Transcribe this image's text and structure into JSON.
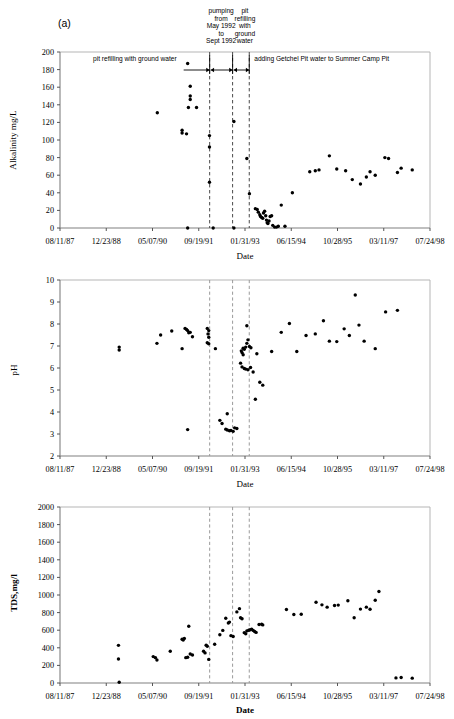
{
  "figure": {
    "panel_label": "(a)",
    "date_axis_title": "Date",
    "x_tick_labels": [
      "08/11/87",
      "12/23/88",
      "05/07/90",
      "09/19/91",
      "01/31/93",
      "06/15/94",
      "10/28/95",
      "03/11/97",
      "07/24/98"
    ],
    "marker_color": "#000000",
    "dashed_line_color": "#9a9a9a",
    "axis_color": "#808080"
  },
  "annotations": {
    "left_span_label": "pit refilling with ground water",
    "pumping_label_lines": [
      "pumping",
      "from",
      "May 1992",
      "to",
      "Sept 1992"
    ],
    "refilling_label_lines": [
      "pit",
      "refilling",
      "with",
      "ground",
      "water"
    ],
    "right_span_label": "adding Getchel Pit water to Summer Camp Pit"
  },
  "chart_data": [
    {
      "type": "scatter",
      "title": "",
      "xlabel": "Date",
      "ylabel": "Alkalinity  mg/L",
      "ylim": [
        0,
        200
      ],
      "ytick_labels": [
        "0",
        "20",
        "40",
        "60",
        "80",
        "100",
        "120",
        "140",
        "160",
        "180",
        "200"
      ],
      "ytick_values": [
        0,
        20,
        40,
        60,
        80,
        100,
        120,
        140,
        160,
        180,
        200
      ],
      "xlim": [
        "08/11/87",
        "07/24/98"
      ],
      "grid": false,
      "legend": "none",
      "event_lines": [
        "05/1992",
        "11/1992",
        "03/1993"
      ],
      "points": [
        {
          "x": 0.263,
          "y": 131
        },
        {
          "x": 0.345,
          "y": 187
        },
        {
          "x": 0.352,
          "y": 161
        },
        {
          "x": 0.352,
          "y": 150
        },
        {
          "x": 0.352,
          "y": 146
        },
        {
          "x": 0.347,
          "y": 137
        },
        {
          "x": 0.369,
          "y": 137
        },
        {
          "x": 0.33,
          "y": 111
        },
        {
          "x": 0.33,
          "y": 108
        },
        {
          "x": 0.342,
          "y": 107
        },
        {
          "x": 0.345,
          "y": 0
        },
        {
          "x": 0.404,
          "y": 105
        },
        {
          "x": 0.404,
          "y": 92
        },
        {
          "x": 0.404,
          "y": 52
        },
        {
          "x": 0.414,
          "y": 0
        },
        {
          "x": 0.47,
          "y": 121
        },
        {
          "x": 0.47,
          "y": 0
        },
        {
          "x": 0.505,
          "y": 79
        },
        {
          "x": 0.512,
          "y": 39
        },
        {
          "x": 0.528,
          "y": 22
        },
        {
          "x": 0.533,
          "y": 21
        },
        {
          "x": 0.536,
          "y": 18
        },
        {
          "x": 0.54,
          "y": 15
        },
        {
          "x": 0.542,
          "y": 13
        },
        {
          "x": 0.545,
          "y": 12
        },
        {
          "x": 0.548,
          "y": 11
        },
        {
          "x": 0.55,
          "y": 17
        },
        {
          "x": 0.553,
          "y": 19
        },
        {
          "x": 0.556,
          "y": 14
        },
        {
          "x": 0.558,
          "y": 9
        },
        {
          "x": 0.56,
          "y": 6
        },
        {
          "x": 0.562,
          "y": 5
        },
        {
          "x": 0.565,
          "y": 8
        },
        {
          "x": 0.568,
          "y": 13
        },
        {
          "x": 0.572,
          "y": 14
        },
        {
          "x": 0.575,
          "y": 3
        },
        {
          "x": 0.58,
          "y": 1
        },
        {
          "x": 0.585,
          "y": 1
        },
        {
          "x": 0.59,
          "y": 2
        },
        {
          "x": 0.598,
          "y": 26
        },
        {
          "x": 0.608,
          "y": 2
        },
        {
          "x": 0.628,
          "y": 40
        },
        {
          "x": 0.675,
          "y": 64
        },
        {
          "x": 0.69,
          "y": 65
        },
        {
          "x": 0.7,
          "y": 66
        },
        {
          "x": 0.728,
          "y": 82
        },
        {
          "x": 0.748,
          "y": 67
        },
        {
          "x": 0.772,
          "y": 65
        },
        {
          "x": 0.79,
          "y": 55
        },
        {
          "x": 0.812,
          "y": 50
        },
        {
          "x": 0.828,
          "y": 58
        },
        {
          "x": 0.838,
          "y": 64
        },
        {
          "x": 0.852,
          "y": 60
        },
        {
          "x": 0.878,
          "y": 80
        },
        {
          "x": 0.888,
          "y": 79
        },
        {
          "x": 0.912,
          "y": 63
        },
        {
          "x": 0.922,
          "y": 68
        },
        {
          "x": 0.952,
          "y": 66
        }
      ]
    },
    {
      "type": "scatter",
      "title": "",
      "xlabel": "Date",
      "ylabel": "pH",
      "ylim": [
        2,
        10
      ],
      "ytick_labels": [
        "2",
        "3",
        "4",
        "5",
        "6",
        "7",
        "8",
        "9",
        "10"
      ],
      "ytick_values": [
        2,
        3,
        4,
        5,
        6,
        7,
        8,
        9,
        10
      ],
      "xlim": [
        "08/11/87",
        "07/24/98"
      ],
      "grid": false,
      "legend": "none",
      "event_lines": [
        "05/1992",
        "11/1992",
        "03/1993"
      ],
      "points": [
        {
          "x": 0.16,
          "y": 6.95
        },
        {
          "x": 0.16,
          "y": 6.82
        },
        {
          "x": 0.262,
          "y": 7.12
        },
        {
          "x": 0.272,
          "y": 7.5
        },
        {
          "x": 0.302,
          "y": 7.68
        },
        {
          "x": 0.338,
          "y": 7.8
        },
        {
          "x": 0.342,
          "y": 7.75
        },
        {
          "x": 0.345,
          "y": 7.7
        },
        {
          "x": 0.348,
          "y": 7.6
        },
        {
          "x": 0.352,
          "y": 7.62
        },
        {
          "x": 0.358,
          "y": 7.42
        },
        {
          "x": 0.33,
          "y": 6.88
        },
        {
          "x": 0.345,
          "y": 3.2
        },
        {
          "x": 0.398,
          "y": 7.8
        },
        {
          "x": 0.402,
          "y": 7.7
        },
        {
          "x": 0.4,
          "y": 7.55
        },
        {
          "x": 0.402,
          "y": 7.4
        },
        {
          "x": 0.398,
          "y": 7.15
        },
        {
          "x": 0.402,
          "y": 7.1
        },
        {
          "x": 0.42,
          "y": 6.88
        },
        {
          "x": 0.432,
          "y": 3.62
        },
        {
          "x": 0.438,
          "y": 3.48
        },
        {
          "x": 0.448,
          "y": 3.22
        },
        {
          "x": 0.452,
          "y": 3.18
        },
        {
          "x": 0.458,
          "y": 3.15
        },
        {
          "x": 0.462,
          "y": 3.16
        },
        {
          "x": 0.468,
          "y": 3.12
        },
        {
          "x": 0.472,
          "y": 3.28
        },
        {
          "x": 0.478,
          "y": 3.25
        },
        {
          "x": 0.452,
          "y": 3.92
        },
        {
          "x": 0.505,
          "y": 7.92
        },
        {
          "x": 0.508,
          "y": 7.28
        },
        {
          "x": 0.505,
          "y": 7.12
        },
        {
          "x": 0.495,
          "y": 6.9
        },
        {
          "x": 0.498,
          "y": 6.85
        },
        {
          "x": 0.502,
          "y": 6.95
        },
        {
          "x": 0.512,
          "y": 6.98
        },
        {
          "x": 0.516,
          "y": 6.92
        },
        {
          "x": 0.49,
          "y": 6.78
        },
        {
          "x": 0.492,
          "y": 6.7
        },
        {
          "x": 0.495,
          "y": 6.6
        },
        {
          "x": 0.488,
          "y": 6.22
        },
        {
          "x": 0.492,
          "y": 6.05
        },
        {
          "x": 0.498,
          "y": 5.98
        },
        {
          "x": 0.502,
          "y": 5.95
        },
        {
          "x": 0.508,
          "y": 5.92
        },
        {
          "x": 0.515,
          "y": 6.02
        },
        {
          "x": 0.522,
          "y": 5.82
        },
        {
          "x": 0.532,
          "y": 6.65
        },
        {
          "x": 0.54,
          "y": 5.35
        },
        {
          "x": 0.548,
          "y": 5.22
        },
        {
          "x": 0.528,
          "y": 4.58
        },
        {
          "x": 0.572,
          "y": 6.75
        },
        {
          "x": 0.598,
          "y": 7.62
        },
        {
          "x": 0.62,
          "y": 8.02
        },
        {
          "x": 0.64,
          "y": 6.75
        },
        {
          "x": 0.665,
          "y": 7.48
        },
        {
          "x": 0.69,
          "y": 7.55
        },
        {
          "x": 0.712,
          "y": 8.15
        },
        {
          "x": 0.728,
          "y": 7.22
        },
        {
          "x": 0.748,
          "y": 7.2
        },
        {
          "x": 0.768,
          "y": 7.78
        },
        {
          "x": 0.782,
          "y": 7.48
        },
        {
          "x": 0.798,
          "y": 9.32
        },
        {
          "x": 0.808,
          "y": 7.95
        },
        {
          "x": 0.822,
          "y": 7.22
        },
        {
          "x": 0.852,
          "y": 6.88
        },
        {
          "x": 0.88,
          "y": 8.55
        },
        {
          "x": 0.912,
          "y": 8.62
        }
      ]
    },
    {
      "type": "scatter",
      "title": "",
      "xlabel": "Date",
      "ylabel": "TDS,mg/l",
      "ylim": [
        0,
        2000
      ],
      "ytick_labels": [
        "0",
        "200",
        "400",
        "600",
        "800",
        "1000",
        "1200",
        "1400",
        "1600",
        "1800",
        "2000"
      ],
      "ytick_values": [
        0,
        200,
        400,
        600,
        800,
        1000,
        1200,
        1400,
        1600,
        1800,
        2000
      ],
      "xlim": [
        "08/11/87",
        "07/24/98"
      ],
      "grid": false,
      "legend": "none",
      "event_lines": [
        "05/1992",
        "11/1992",
        "03/1993"
      ],
      "points": [
        {
          "x": 0.158,
          "y": 428
        },
        {
          "x": 0.158,
          "y": 272
        },
        {
          "x": 0.16,
          "y": 8
        },
        {
          "x": 0.252,
          "y": 300
        },
        {
          "x": 0.258,
          "y": 288
        },
        {
          "x": 0.262,
          "y": 262
        },
        {
          "x": 0.298,
          "y": 360
        },
        {
          "x": 0.33,
          "y": 498
        },
        {
          "x": 0.333,
          "y": 488
        },
        {
          "x": 0.336,
          "y": 505
        },
        {
          "x": 0.34,
          "y": 288
        },
        {
          "x": 0.345,
          "y": 292
        },
        {
          "x": 0.352,
          "y": 330
        },
        {
          "x": 0.358,
          "y": 318
        },
        {
          "x": 0.348,
          "y": 645
        },
        {
          "x": 0.388,
          "y": 360
        },
        {
          "x": 0.392,
          "y": 342
        },
        {
          "x": 0.395,
          "y": 430
        },
        {
          "x": 0.398,
          "y": 418
        },
        {
          "x": 0.402,
          "y": 268
        },
        {
          "x": 0.418,
          "y": 440
        },
        {
          "x": 0.432,
          "y": 548
        },
        {
          "x": 0.44,
          "y": 598
        },
        {
          "x": 0.448,
          "y": 735
        },
        {
          "x": 0.455,
          "y": 682
        },
        {
          "x": 0.458,
          "y": 692
        },
        {
          "x": 0.462,
          "y": 538
        },
        {
          "x": 0.468,
          "y": 528
        },
        {
          "x": 0.478,
          "y": 808
        },
        {
          "x": 0.485,
          "y": 845
        },
        {
          "x": 0.488,
          "y": 742
        },
        {
          "x": 0.492,
          "y": 730
        },
        {
          "x": 0.498,
          "y": 572
        },
        {
          "x": 0.502,
          "y": 560
        },
        {
          "x": 0.505,
          "y": 592
        },
        {
          "x": 0.51,
          "y": 600
        },
        {
          "x": 0.514,
          "y": 605
        },
        {
          "x": 0.518,
          "y": 612
        },
        {
          "x": 0.522,
          "y": 598
        },
        {
          "x": 0.526,
          "y": 585
        },
        {
          "x": 0.53,
          "y": 575
        },
        {
          "x": 0.538,
          "y": 665
        },
        {
          "x": 0.545,
          "y": 668
        },
        {
          "x": 0.548,
          "y": 660
        },
        {
          "x": 0.612,
          "y": 835
        },
        {
          "x": 0.632,
          "y": 778
        },
        {
          "x": 0.652,
          "y": 782
        },
        {
          "x": 0.692,
          "y": 918
        },
        {
          "x": 0.708,
          "y": 888
        },
        {
          "x": 0.722,
          "y": 862
        },
        {
          "x": 0.742,
          "y": 880
        },
        {
          "x": 0.752,
          "y": 885
        },
        {
          "x": 0.778,
          "y": 935
        },
        {
          "x": 0.795,
          "y": 742
        },
        {
          "x": 0.812,
          "y": 840
        },
        {
          "x": 0.828,
          "y": 862
        },
        {
          "x": 0.838,
          "y": 838
        },
        {
          "x": 0.852,
          "y": 940
        },
        {
          "x": 0.862,
          "y": 1040
        },
        {
          "x": 0.908,
          "y": 58
        },
        {
          "x": 0.922,
          "y": 62
        },
        {
          "x": 0.952,
          "y": 55
        }
      ]
    }
  ]
}
